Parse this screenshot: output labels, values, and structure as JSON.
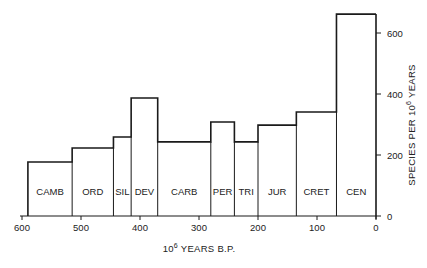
{
  "chart_data": {
    "type": "bar",
    "subtype": "step histogram (variable-width periods)",
    "title": "",
    "xlabel": "10^6 YEARS B.P.",
    "xlabel_parts": {
      "base": "10",
      "exp": "6",
      "rest": " YEARS B.P."
    },
    "ylabel": "SPECIES PER 10^6 YEARS",
    "ylabel_parts": {
      "pre": "SPECIES PER 10",
      "exp": "6",
      "rest": " YEARS"
    },
    "x_axis": {
      "reversed": true,
      "range": [
        600,
        0
      ],
      "ticks": [
        600,
        500,
        400,
        300,
        200,
        100,
        0
      ]
    },
    "y_axis": {
      "position": "right",
      "range": [
        0,
        680
      ],
      "ticks": [
        0,
        200,
        400,
        600
      ]
    },
    "grid": false,
    "legend": null,
    "categories": [
      "CAMB",
      "ORD",
      "SIL",
      "DEV",
      "CARB",
      "PER",
      "TRI",
      "JUR",
      "CRET",
      "CEN"
    ],
    "bins": [
      {
        "label": "CAMB",
        "start": 590,
        "end": 515,
        "value": 177
      },
      {
        "label": "ORD",
        "start": 515,
        "end": 445,
        "value": 223
      },
      {
        "label": "SIL",
        "start": 445,
        "end": 415,
        "value": 259
      },
      {
        "label": "DEV",
        "start": 415,
        "end": 370,
        "value": 387
      },
      {
        "label": "CARB",
        "start": 370,
        "end": 280,
        "value": 243
      },
      {
        "label": "PER",
        "start": 280,
        "end": 240,
        "value": 308
      },
      {
        "label": "TRI",
        "start": 240,
        "end": 200,
        "value": 243
      },
      {
        "label": "JUR",
        "start": 200,
        "end": 135,
        "value": 298
      },
      {
        "label": "CRET",
        "start": 135,
        "end": 67,
        "value": 341
      },
      {
        "label": "CEN",
        "start": 67,
        "end": 0,
        "value": 662
      }
    ],
    "values": [
      177,
      223,
      259,
      387,
      243,
      308,
      243,
      298,
      341,
      662
    ]
  }
}
